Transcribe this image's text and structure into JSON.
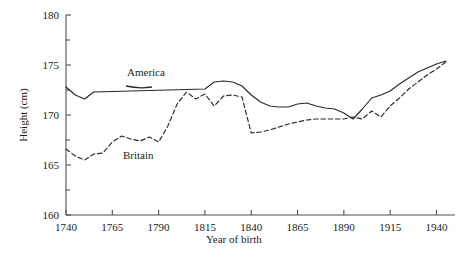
{
  "chart_data": {
    "type": "line",
    "title": "",
    "subtitle": "",
    "xlabel": "Year of birth",
    "ylabel": "Height (cm)",
    "xlim": [
      1740,
      1950
    ],
    "ylim": [
      160,
      180
    ],
    "xticks": [
      1740,
      1765,
      1790,
      1815,
      1840,
      1865,
      1890,
      1915,
      1940
    ],
    "xtick_labels": [
      "1740",
      "1765",
      "1790",
      "1815",
      "1840",
      "1865",
      "1890",
      "1915",
      "1940"
    ],
    "yticks": [
      160,
      165,
      170,
      175,
      180
    ],
    "ytick_labels": [
      "160",
      "165",
      "170",
      "175",
      "180"
    ],
    "y_minor_ticks": [
      162.5,
      167.5,
      172.5,
      177.5
    ],
    "grid": false,
    "legend_position": "inline-annotations",
    "series": [
      {
        "name": "America",
        "style": "solid",
        "label_text": "America",
        "x": [
          1740,
          1745,
          1750,
          1755,
          1815,
          1820,
          1825,
          1830,
          1835,
          1840,
          1845,
          1850,
          1855,
          1860,
          1865,
          1870,
          1875,
          1880,
          1885,
          1890,
          1895,
          1900,
          1905,
          1910,
          1915,
          1920,
          1925,
          1930,
          1935,
          1940,
          1945
        ],
        "y": [
          172.8,
          172.0,
          171.6,
          172.3,
          172.6,
          173.3,
          173.4,
          173.3,
          172.9,
          172.0,
          171.3,
          170.9,
          170.8,
          170.8,
          171.1,
          171.2,
          170.9,
          170.7,
          170.6,
          170.2,
          169.6,
          170.6,
          171.7,
          172.0,
          172.4,
          173.1,
          173.7,
          174.3,
          174.7,
          175.1,
          175.4
        ]
      },
      {
        "name": "Britain",
        "style": "dashed",
        "label_text": "Britain",
        "x": [
          1740,
          1745,
          1750,
          1755,
          1760,
          1765,
          1770,
          1775,
          1780,
          1785,
          1790,
          1795,
          1800,
          1805,
          1810,
          1815,
          1820,
          1825,
          1830,
          1835,
          1840,
          1845,
          1850,
          1855,
          1860,
          1865,
          1870,
          1875,
          1880,
          1885,
          1890,
          1895,
          1900,
          1905,
          1910,
          1915,
          1920,
          1925,
          1930,
          1935,
          1940,
          1945
        ],
        "y": [
          166.6,
          165.9,
          165.5,
          166.1,
          166.2,
          167.3,
          167.9,
          167.6,
          167.4,
          167.8,
          167.3,
          168.9,
          171.1,
          172.3,
          171.6,
          172.1,
          170.9,
          171.9,
          172.0,
          171.8,
          168.2,
          168.3,
          168.5,
          168.8,
          169.1,
          169.3,
          169.5,
          169.6,
          169.6,
          169.6,
          169.6,
          169.8,
          169.6,
          170.4,
          169.8,
          170.9,
          171.7,
          172.6,
          173.3,
          174.0,
          174.6,
          175.3
        ]
      }
    ]
  },
  "axes": {
    "x_axis_name": "year-of-birth-axis",
    "y_axis_name": "height-axis"
  }
}
